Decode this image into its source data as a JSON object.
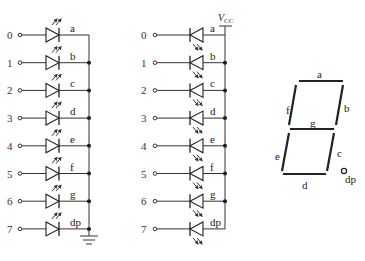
{
  "diagram": {
    "common_cathode": {
      "name": "common-cathode",
      "inputs": [
        "0",
        "1",
        "2",
        "3",
        "4",
        "5",
        "6",
        "7"
      ],
      "segments": [
        "a",
        "b",
        "c",
        "d",
        "e",
        "f",
        "g",
        "dp"
      ],
      "common_terminal": "ground"
    },
    "common_anode": {
      "name": "common-anode",
      "inputs": [
        "0",
        "1",
        "2",
        "3",
        "4",
        "5",
        "6",
        "7"
      ],
      "segments": [
        "a",
        "b",
        "c",
        "d",
        "e",
        "f",
        "g",
        "dp"
      ],
      "supply_label": "V",
      "supply_sub": "CC"
    },
    "display": {
      "segment_labels": {
        "a": "a",
        "b": "b",
        "c": "c",
        "d": "d",
        "e": "e",
        "f": "f",
        "g": "g",
        "dp": "dp"
      }
    }
  }
}
